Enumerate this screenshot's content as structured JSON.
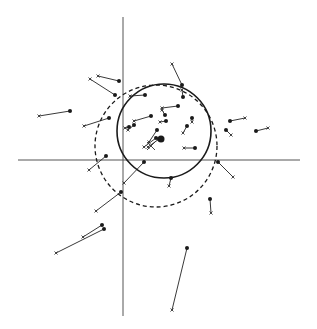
{
  "diagram": {
    "type": "vector displacement plot",
    "axes": {
      "x_axis": {
        "x1": 18,
        "y1": 160,
        "x2": 300,
        "y2": 160
      },
      "y_axis": {
        "x1": 123,
        "y1": 17,
        "x2": 123,
        "y2": 316
      }
    },
    "circles": [
      {
        "name": "solid-circle",
        "style": "solid",
        "cx": 164,
        "cy": 131,
        "r": 47
      },
      {
        "name": "dashed-circle",
        "style": "dashed",
        "cx": 156,
        "cy": 146,
        "r": 61
      }
    ],
    "vectors": [
      {
        "dot": [
          119,
          81
        ],
        "cross": [
          98,
          76
        ]
      },
      {
        "dot": [
          115,
          95
        ],
        "cross": [
          90,
          79
        ]
      },
      {
        "dot": [
          70,
          111
        ],
        "cross": [
          39,
          116
        ]
      },
      {
        "dot": [
          109,
          118
        ],
        "cross": [
          84,
          126
        ]
      },
      {
        "dot": [
          145,
          95
        ],
        "cross": [
          130,
          96
        ]
      },
      {
        "dot": [
          182,
          85
        ],
        "cross": [
          172,
          64
        ]
      },
      {
        "dot": [
          183,
          97
        ],
        "cross": [
          182,
          90
        ]
      },
      {
        "dot": [
          178,
          106
        ],
        "cross": [
          162,
          108
        ]
      },
      {
        "dot": [
          151,
          116
        ],
        "cross": [
          134,
          121
        ]
      },
      {
        "dot": [
          165,
          115
        ],
        "cross": [
          162,
          110
        ]
      },
      {
        "dot": [
          166,
          121
        ],
        "cross": [
          160,
          122
        ]
      },
      {
        "dot": [
          192,
          118
        ],
        "cross": [
          192,
          122
        ]
      },
      {
        "dot": [
          187,
          126
        ],
        "cross": [
          183,
          133
        ]
      },
      {
        "dot": [
          230,
          121
        ],
        "cross": [
          245,
          118
        ]
      },
      {
        "dot": [
          226,
          130
        ],
        "cross": [
          231,
          135
        ]
      },
      {
        "dot": [
          256,
          131
        ],
        "cross": [
          268,
          128
        ]
      },
      {
        "dot": [
          129,
          127
        ],
        "cross": [
          125,
          128
        ]
      },
      {
        "dot": [
          134,
          125
        ],
        "cross": [
          128,
          130
        ]
      },
      {
        "dot": [
          157,
          130
        ],
        "cross": [
          149,
          142
        ]
      },
      {
        "dot": [
          156,
          138
        ],
        "cross": [
          144,
          147
        ]
      },
      {
        "dot": [
          159,
          139
        ],
        "cross": [
          148,
          147
        ]
      },
      {
        "dot": [
          195,
          148
        ],
        "cross": [
          184,
          148
        ]
      },
      {
        "dot": [
          106,
          156
        ],
        "cross": [
          89,
          170
        ]
      },
      {
        "dot": [
          144,
          162
        ],
        "cross": [
          124,
          183
        ]
      },
      {
        "dot": [
          171,
          178
        ],
        "cross": [
          169,
          186
        ]
      },
      {
        "dot": [
          218,
          162
        ],
        "cross": [
          233,
          177
        ]
      },
      {
        "dot": [
          121,
          192
        ],
        "cross": [
          96,
          211
        ]
      },
      {
        "dot": [
          210,
          199
        ],
        "cross": [
          211,
          213
        ]
      },
      {
        "dot": [
          102,
          225
        ],
        "cross": [
          83,
          237
        ]
      },
      {
        "dot": [
          104,
          229
        ],
        "cross": [
          56,
          253
        ]
      },
      {
        "dot": [
          187,
          248
        ],
        "cross": [
          172,
          310
        ]
      }
    ],
    "large_dot": {
      "cx": 161,
      "cy": 139,
      "r": 3.5
    },
    "large_cross": {
      "cx": 151,
      "cy": 146,
      "size": 4
    }
  }
}
